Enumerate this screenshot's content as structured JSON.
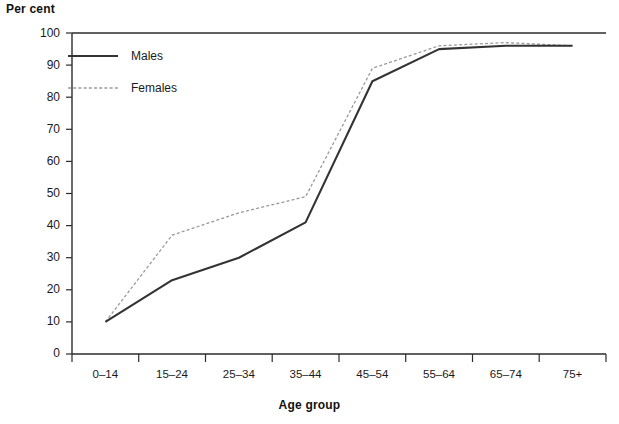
{
  "chart_data": {
    "type": "line",
    "title": "",
    "ylabel": "Per cent",
    "xlabel": "Age group",
    "categories": [
      "0–14",
      "15–24",
      "25–34",
      "35–44",
      "45–54",
      "55–64",
      "65–74",
      "75+"
    ],
    "yticks": [
      0,
      10,
      20,
      30,
      40,
      50,
      60,
      70,
      80,
      90,
      100
    ],
    "ylim": [
      0,
      100
    ],
    "grid": false,
    "legend_position": "top-left-inside",
    "series": [
      {
        "name": "Males",
        "style": "solid",
        "color": "#333333",
        "values": [
          10,
          23,
          30,
          41,
          85,
          95,
          96,
          96
        ]
      },
      {
        "name": "Females",
        "style": "dotted",
        "color": "#999999",
        "values": [
          10,
          37,
          44,
          49,
          89,
          96,
          97,
          96
        ]
      }
    ]
  },
  "legend": {
    "items": [
      {
        "label": "Males"
      },
      {
        "label": "Females"
      }
    ]
  },
  "axes": {
    "y_title": "Per cent",
    "x_title": "Age group",
    "y_tick_labels": [
      "100",
      "90",
      "80",
      "70",
      "60",
      "50",
      "40",
      "30",
      "20",
      "10",
      "0"
    ],
    "x_tick_labels": [
      "0–14",
      "15–24",
      "25–34",
      "35–44",
      "45–54",
      "55–64",
      "65–74",
      "75+"
    ]
  },
  "colors": {
    "males_line": "#333333",
    "females_line": "#9a9a9a",
    "axis": "#2b2b2b",
    "background": "#ffffff"
  }
}
